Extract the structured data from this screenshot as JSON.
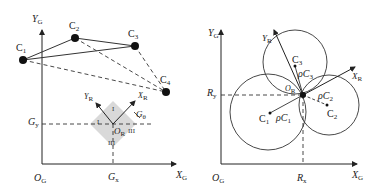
{
  "left_panel": {
    "axes": {
      "y_label": "Y",
      "y_sub": "G",
      "x_label": "X",
      "x_sub": "G",
      "origin": "O",
      "origin_sub": "G"
    },
    "nodes": [
      {
        "label": "C",
        "sub": "1"
      },
      {
        "label": "C",
        "sub": "2"
      },
      {
        "label": "C",
        "sub": "3"
      },
      {
        "label": "C",
        "sub": "4"
      }
    ],
    "robot": {
      "yr_label": "Y",
      "yr_sub": "R",
      "xr_label": "X",
      "xr_sub": "R",
      "or_label": "O",
      "or_sub": "R",
      "theta_label": "G",
      "theta_sub": "θ",
      "gx_label": "G",
      "gx_sub": "x",
      "gy_label": "G",
      "gy_sub": "y",
      "sectors": [
        "I",
        "I",
        "III",
        "III"
      ]
    }
  },
  "right_panel": {
    "axes": {
      "y_label": "Y",
      "y_sub": "G",
      "x_label": "X",
      "x_sub": "G",
      "origin": "O",
      "origin_sub": "G"
    },
    "rx_label": "R",
    "rx_sub": "x",
    "ry_label": "R",
    "ry_sub": "y",
    "or_label": "O",
    "or_sub": "R",
    "yr_label": "Y",
    "yr_sub": "R",
    "xr_label": "X",
    "xr_sub": "R",
    "circles": [
      {
        "center": "C",
        "center_sub": "1",
        "radius": "ρC",
        "radius_sub": "1"
      },
      {
        "center": "C",
        "center_sub": "2",
        "radius": "ρC",
        "radius_sub": "2"
      },
      {
        "center": "C",
        "center_sub": "3",
        "radius": "ρC",
        "radius_sub": "3"
      }
    ]
  },
  "colors": {
    "stroke": "#222222",
    "robot_fill": "#d9d9d9"
  }
}
